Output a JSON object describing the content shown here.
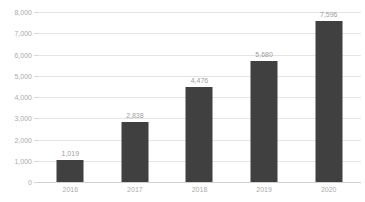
{
  "chart_data": {
    "type": "bar",
    "title": "",
    "xlabel": "",
    "ylabel": "",
    "categories": [
      "2016",
      "2017",
      "2018",
      "2019",
      "2020"
    ],
    "values": [
      1019,
      2838,
      4476,
      5680,
      7596
    ],
    "value_labels": [
      "1,019",
      "2,838",
      "4,476",
      "5,680",
      "7,596"
    ],
    "ylim": [
      0,
      8000
    ],
    "ytick_interval": 1000,
    "yticks": [
      0,
      1000,
      2000,
      3000,
      4000,
      5000,
      6000,
      7000,
      8000
    ],
    "ytick_labels": [
      "0",
      "1,000",
      "2,000",
      "3,000",
      "4,000",
      "5,000",
      "6,000",
      "7,000",
      "8,000"
    ],
    "grid": true,
    "legend": false,
    "colors": {
      "bar": "#404040",
      "gridline": "#e4e4e4",
      "baseline": "#cfcfcf",
      "axis_text": "#ababab",
      "value_label_text": "#9e9e9e",
      "background": "#ffffff"
    }
  }
}
